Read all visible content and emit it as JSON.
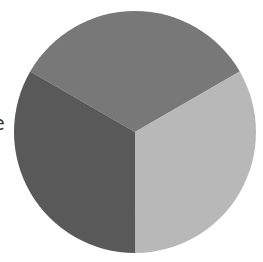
{
  "chart_data": {
    "type": "pie",
    "title": "",
    "categories": [
      "Slice A (top)",
      "Slice B (right)",
      "Slice C (left)"
    ],
    "values": [
      33.33,
      33.33,
      33.34
    ],
    "colors": [
      "#787878",
      "#b8b8b8",
      "#595959"
    ],
    "start_angle_deg": 150,
    "direction": "clockwise",
    "legend": "none",
    "annotations": [
      "e"
    ]
  },
  "labels": {
    "cut_off_fragment": "e"
  },
  "geometry": {
    "cx": 135,
    "cy": 132,
    "r": 121
  }
}
